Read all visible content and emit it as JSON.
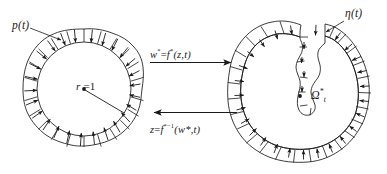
{
  "figure": {
    "background_color": "#ffffff",
    "stroke_color": "#1a1a1a",
    "width": 387,
    "height": 174
  },
  "left_panel": {
    "name": "unit-disk-panel",
    "pressure_label": "p(t)",
    "radius_label_var": "r",
    "radius_label_eq": " =1",
    "radius_label": "r =1",
    "center_dot": true,
    "boundary_cells": 22,
    "arrow_direction": "inward"
  },
  "right_panel": {
    "name": "deformed-domain-panel",
    "interface_label": "η(t)",
    "domain_label_base": "Ω",
    "domain_label_sup": "*",
    "domain_label_sub": "t",
    "domain_label": "Ω*t",
    "center_dot": true,
    "boundary_cells": 30,
    "arrow_direction": "inward",
    "has_fjord": true
  },
  "map_arrows": {
    "forward": {
      "name": "forward-map-arrow",
      "label_w": "w",
      "label_w_star": "*",
      "label_eq": "=",
      "label_f": "f",
      "label_f_star": "*",
      "label_args": "(z,t)",
      "label": "w*=f*(z,t)",
      "direction": "right"
    },
    "inverse": {
      "name": "inverse-map-arrow",
      "label_z": "z",
      "label_eq": "=",
      "label_f": "f",
      "label_f_exp": "*−1",
      "label_args": "(w*,t)",
      "label": "z=f*⁻¹(w*,t)",
      "direction": "left"
    }
  }
}
